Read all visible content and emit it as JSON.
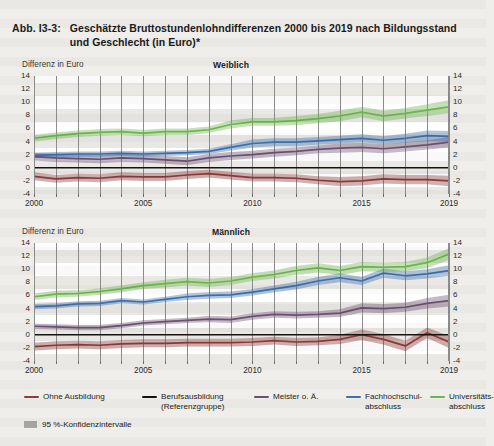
{
  "figure": {
    "number": "Abb. I3-3:",
    "title": "Geschätzte Bruttostundenlohndifferenzen 2000 bis 2019 nach Bildungsstand und Geschlecht (in Euro)*"
  },
  "legend": {
    "items": [
      {
        "label": "Ohne Ausbildung",
        "color": "#8c3a3a"
      },
      {
        "label": "Berufsausbildung\n(Referenzgruppe)",
        "color": "#15130f"
      },
      {
        "label": "Meister o. Ä.",
        "color": "#6b5170"
      },
      {
        "label": "Fachhochschul-\nabschluss",
        "color": "#3d6fab"
      },
      {
        "label": "Universitäts-\nabschluss",
        "color": "#6cb44c"
      }
    ],
    "confidence_label": "95 %-Konfidenzintervalle",
    "confidence_color": "#a9a8a4"
  },
  "chart_data": {
    "type": "line",
    "title": "Geschätzte Bruttostundenlohndifferenzen 2000 bis 2019 nach Bildungsstand und Geschlecht (in Euro)*",
    "xlabel": "",
    "ylabel": "Differenz in Euro",
    "ylim": [
      -4,
      14
    ],
    "yticks": [
      -4,
      -2,
      0,
      2,
      4,
      6,
      8,
      10,
      12,
      14
    ],
    "ytick_labels": [
      "-4",
      "-2",
      "0",
      "2",
      "4",
      "6",
      "8",
      "10",
      "12",
      "14"
    ],
    "grid": true,
    "legend_position": "bottom",
    "x": [
      2000,
      2001,
      2002,
      2003,
      2004,
      2005,
      2006,
      2007,
      2008,
      2009,
      2010,
      2011,
      2012,
      2013,
      2014,
      2015,
      2016,
      2017,
      2018,
      2019
    ],
    "xtick_labels": [
      "2000",
      "2005",
      "2010",
      "2015",
      "2019"
    ],
    "xticks": [
      2000,
      2005,
      2010,
      2015,
      2019
    ],
    "panels": [
      {
        "name": "Weiblich",
        "series": [
          {
            "name": "Ohne Ausbildung",
            "color": "#8c3a3a",
            "values": [
              -1.3,
              -1.7,
              -1.5,
              -1.6,
              -1.3,
              -1.4,
              -1.4,
              -1.1,
              -0.9,
              -1.2,
              -1.5,
              -1.5,
              -1.6,
              -1.9,
              -2.1,
              -2.0,
              -1.7,
              -1.8,
              -1.8,
              -2.0
            ],
            "ci_low": [
              -1.9,
              -2.3,
              -2.1,
              -2.2,
              -1.9,
              -2.0,
              -2.0,
              -1.7,
              -1.5,
              -1.8,
              -2.1,
              -2.1,
              -2.2,
              -2.5,
              -2.8,
              -2.7,
              -2.4,
              -2.5,
              -2.5,
              -2.8
            ],
            "ci_high": [
              -0.7,
              -1.1,
              -0.9,
              -1.0,
              -0.7,
              -0.8,
              -0.8,
              -0.5,
              -0.3,
              -0.6,
              -0.9,
              -0.9,
              -1.0,
              -1.3,
              -1.4,
              -1.3,
              -1.0,
              -1.1,
              -1.1,
              -1.2
            ]
          },
          {
            "name": "Berufsausbildung (Referenzgruppe)",
            "color": "#15130f",
            "values": [
              0,
              0,
              0,
              0,
              0,
              0,
              0,
              0,
              0,
              0,
              0,
              0,
              0,
              0,
              0,
              0,
              0,
              0,
              0,
              0
            ],
            "ci_low": [
              0,
              0,
              0,
              0,
              0,
              0,
              0,
              0,
              0,
              0,
              0,
              0,
              0,
              0,
              0,
              0,
              0,
              0,
              0,
              0
            ],
            "ci_high": [
              0,
              0,
              0,
              0,
              0,
              0,
              0,
              0,
              0,
              0,
              0,
              0,
              0,
              0,
              0,
              0,
              0,
              0,
              0,
              0
            ]
          },
          {
            "name": "Meister o. Ä.",
            "color": "#6b5170",
            "values": [
              1.7,
              1.5,
              1.4,
              1.3,
              1.5,
              1.4,
              1.2,
              1.0,
              1.5,
              1.8,
              2.0,
              2.3,
              2.5,
              2.8,
              3.0,
              3.1,
              2.9,
              3.2,
              3.5,
              3.9
            ],
            "ci_low": [
              1.1,
              0.9,
              0.8,
              0.7,
              0.9,
              0.8,
              0.6,
              0.4,
              0.9,
              1.2,
              1.4,
              1.7,
              1.9,
              2.2,
              2.3,
              2.4,
              2.2,
              2.5,
              2.8,
              3.1
            ],
            "ci_high": [
              2.3,
              2.1,
              2.0,
              1.9,
              2.1,
              2.0,
              1.8,
              1.6,
              2.1,
              2.4,
              2.6,
              2.9,
              3.1,
              3.4,
              3.7,
              3.8,
              3.6,
              3.9,
              4.2,
              4.7
            ]
          },
          {
            "name": "Fachhochschulabschluss",
            "color": "#3d6fab",
            "values": [
              1.9,
              2.0,
              2.1,
              2.1,
              2.2,
              2.1,
              2.2,
              2.3,
              2.5,
              3.1,
              3.7,
              3.9,
              3.9,
              4.1,
              4.3,
              4.5,
              4.2,
              4.5,
              4.9,
              4.8
            ],
            "ci_low": [
              1.5,
              1.6,
              1.7,
              1.7,
              1.8,
              1.7,
              1.8,
              1.9,
              2.1,
              2.6,
              3.1,
              3.3,
              3.3,
              3.5,
              3.7,
              3.9,
              3.6,
              3.8,
              4.1,
              4.0
            ],
            "ci_high": [
              2.3,
              2.4,
              2.5,
              2.5,
              2.6,
              2.5,
              2.6,
              2.7,
              2.9,
              3.6,
              4.3,
              4.5,
              4.5,
              4.7,
              4.9,
              5.1,
              4.8,
              5.2,
              5.7,
              5.6
            ]
          },
          {
            "name": "Universitätsabschluss",
            "color": "#6cb44c",
            "values": [
              4.5,
              4.9,
              5.2,
              5.4,
              5.5,
              5.3,
              5.5,
              5.5,
              5.8,
              6.6,
              7.0,
              7.0,
              7.2,
              7.5,
              7.9,
              8.5,
              7.9,
              8.3,
              8.8,
              9.3
            ],
            "ci_low": [
              4.0,
              4.4,
              4.7,
              4.9,
              5.0,
              4.8,
              5.0,
              5.0,
              5.3,
              6.0,
              6.4,
              6.4,
              6.5,
              6.8,
              7.1,
              7.7,
              7.1,
              7.5,
              7.9,
              8.3
            ],
            "ci_high": [
              5.0,
              5.4,
              5.7,
              5.9,
              6.0,
              5.8,
              6.0,
              6.0,
              6.3,
              7.2,
              7.6,
              7.6,
              7.9,
              8.2,
              8.7,
              9.3,
              8.7,
              9.1,
              9.7,
              10.3
            ]
          }
        ]
      },
      {
        "name": "Männlich",
        "series": [
          {
            "name": "Ohne Ausbildung",
            "color": "#8c3a3a",
            "values": [
              -1.8,
              -1.6,
              -1.5,
              -1.6,
              -1.4,
              -1.3,
              -1.3,
              -1.2,
              -1.2,
              -1.2,
              -1.1,
              -0.9,
              -1.1,
              -1.0,
              -0.7,
              0.0,
              -0.7,
              -1.7,
              0.3,
              -1.1
            ],
            "ci_low": [
              -2.4,
              -2.2,
              -2.1,
              -2.2,
              -2.0,
              -1.9,
              -1.9,
              -1.8,
              -1.8,
              -1.8,
              -1.7,
              -1.5,
              -1.7,
              -1.6,
              -1.4,
              -0.8,
              -1.5,
              -2.5,
              -0.5,
              -2.0
            ],
            "ci_high": [
              -1.2,
              -1.0,
              -0.9,
              -1.0,
              -0.8,
              -0.7,
              -0.7,
              -0.6,
              -0.6,
              -0.6,
              -0.5,
              -0.3,
              -0.5,
              -0.4,
              0.0,
              0.8,
              0.1,
              -0.9,
              1.1,
              -0.2
            ]
          },
          {
            "name": "Berufsausbildung (Referenzgruppe)",
            "color": "#15130f",
            "values": [
              0,
              0,
              0,
              0,
              0,
              0,
              0,
              0,
              0,
              0,
              0,
              0,
              0,
              0,
              0,
              0,
              0,
              0,
              0,
              0
            ],
            "ci_low": [
              0,
              0,
              0,
              0,
              0,
              0,
              0,
              0,
              0,
              0,
              0,
              0,
              0,
              0,
              0,
              0,
              0,
              0,
              0,
              0
            ],
            "ci_high": [
              0,
              0,
              0,
              0,
              0,
              0,
              0,
              0,
              0,
              0,
              0,
              0,
              0,
              0,
              0,
              0,
              0,
              0,
              0,
              0
            ]
          },
          {
            "name": "Meister o. Ä.",
            "color": "#6b5170",
            "values": [
              1.3,
              1.2,
              1.1,
              1.1,
              1.4,
              1.8,
              2.0,
              2.2,
              2.4,
              2.3,
              2.8,
              3.1,
              3.0,
              3.1,
              3.3,
              4.1,
              4.0,
              4.2,
              4.8,
              5.2
            ],
            "ci_low": [
              0.9,
              0.8,
              0.7,
              0.7,
              1.0,
              1.4,
              1.6,
              1.8,
              1.9,
              1.8,
              2.3,
              2.6,
              2.5,
              2.6,
              2.7,
              3.4,
              3.3,
              3.5,
              4.0,
              4.3
            ],
            "ci_high": [
              1.7,
              1.6,
              1.5,
              1.5,
              1.8,
              2.2,
              2.4,
              2.6,
              2.9,
              2.8,
              3.3,
              3.6,
              3.5,
              3.6,
              3.9,
              4.8,
              4.7,
              4.9,
              5.6,
              6.1
            ]
          },
          {
            "name": "Fachhochschulabschluss",
            "color": "#3d6fab",
            "values": [
              4.3,
              4.4,
              4.7,
              4.8,
              5.2,
              5.0,
              5.4,
              5.8,
              6.0,
              6.1,
              6.5,
              7.0,
              7.5,
              8.2,
              8.7,
              8.2,
              9.4,
              9.0,
              9.3,
              9.8
            ],
            "ci_low": [
              3.9,
              4.0,
              4.3,
              4.4,
              4.8,
              4.6,
              5.0,
              5.3,
              5.5,
              5.6,
              6.0,
              6.5,
              6.9,
              7.6,
              8.0,
              7.6,
              8.7,
              8.3,
              8.6,
              9.0
            ],
            "ci_high": [
              4.7,
              4.8,
              5.1,
              5.2,
              5.6,
              5.4,
              5.8,
              6.3,
              6.5,
              6.6,
              7.0,
              7.5,
              8.1,
              8.8,
              9.4,
              8.8,
              10.1,
              9.7,
              10.0,
              10.6
            ]
          },
          {
            "name": "Universitätsabschluss",
            "color": "#6cb44c",
            "values": [
              5.8,
              6.2,
              6.3,
              6.6,
              7.0,
              7.5,
              7.8,
              8.1,
              7.9,
              8.2,
              8.8,
              9.2,
              9.8,
              10.2,
              9.8,
              10.4,
              10.3,
              10.4,
              11.0,
              12.3
            ],
            "ci_low": [
              5.3,
              5.7,
              5.8,
              6.1,
              6.5,
              7.0,
              7.2,
              7.5,
              7.3,
              7.6,
              8.2,
              8.6,
              9.1,
              9.5,
              9.1,
              9.7,
              9.6,
              9.7,
              10.2,
              11.4
            ],
            "ci_high": [
              6.3,
              6.7,
              6.8,
              7.1,
              7.5,
              8.0,
              8.4,
              8.7,
              8.5,
              8.8,
              9.4,
              9.8,
              10.5,
              10.9,
              10.5,
              11.1,
              11.0,
              11.1,
              11.8,
              13.2
            ]
          }
        ]
      }
    ]
  }
}
